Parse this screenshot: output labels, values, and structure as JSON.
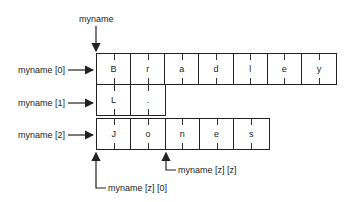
{
  "diagram": {
    "title_label": "myname",
    "rows": [
      {
        "label": "myname [0]",
        "cells": [
          "B",
          "r",
          "a",
          "d",
          "l",
          "e",
          "y"
        ]
      },
      {
        "label": "myname [1]",
        "cells": [
          "L",
          "."
        ]
      },
      {
        "label": "myname [2]",
        "cells": [
          "J",
          "o",
          "n",
          "e",
          "s"
        ]
      }
    ],
    "pointer_labels": {
      "element_zz": "myname [z] [z]",
      "element_z0": "myname [z] [0]"
    }
  }
}
